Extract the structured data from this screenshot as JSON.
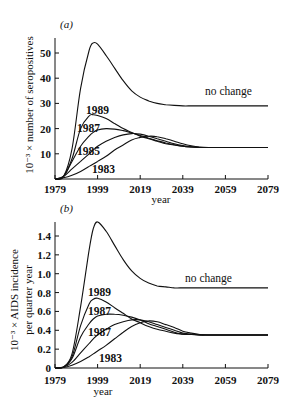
{
  "chart_data": [
    {
      "type": "line",
      "panel": "(a)",
      "title": "",
      "xlabel": "year",
      "ylabel": "10⁻³ × number of seropositives",
      "xlim": [
        1979,
        2079
      ],
      "ylim": [
        0,
        55
      ],
      "xticks": [
        "1979",
        "1999",
        "2019",
        "2039",
        "2059",
        "2079"
      ],
      "yticks": [
        "10",
        "20",
        "30",
        "40",
        "50"
      ],
      "grid": false,
      "x": [
        1979,
        1983,
        1987,
        1991,
        1995,
        1997,
        1999,
        2003,
        2007,
        2011,
        2015,
        2019,
        2023,
        2027,
        2031,
        2035,
        2039,
        2043,
        2047,
        2051,
        2055,
        2059,
        2063,
        2067,
        2071,
        2075,
        2079
      ],
      "series": [
        {
          "name": "no change",
          "values": [
            0,
            1,
            12,
            36,
            51,
            54,
            53.5,
            49,
            44,
            39,
            35,
            32.5,
            31,
            30,
            29.5,
            29.2,
            29,
            29,
            29,
            29,
            29,
            29,
            29,
            29,
            29,
            29,
            29
          ]
        },
        {
          "name": "1989",
          "values": [
            0,
            1,
            8,
            20,
            25,
            25.5,
            25.2,
            24,
            22,
            20,
            18.5,
            17,
            16,
            15,
            14,
            13.5,
            13,
            12.7,
            12.5,
            12.5,
            12.5,
            12.5,
            12.5,
            12.5,
            12.5,
            12.5,
            12.5
          ]
        },
        {
          "name": "1987",
          "values": [
            0,
            1,
            7,
            13,
            17,
            18.5,
            19.5,
            20,
            19.8,
            19.2,
            18.3,
            17.3,
            16.2,
            15.2,
            14.3,
            13.6,
            13,
            12.7,
            12.5,
            12.5,
            12.5,
            12.5,
            12.5,
            12.5,
            12.5,
            12.5,
            12.5
          ]
        },
        {
          "name": "1985",
          "values": [
            0,
            1,
            4,
            7,
            10,
            11.5,
            13,
            15,
            16.5,
            17.5,
            18,
            17.8,
            17,
            16,
            15,
            14,
            13.3,
            12.8,
            12.5,
            12.5,
            12.5,
            12.5,
            12.5,
            12.5,
            12.5,
            12.5,
            12.5
          ]
        },
        {
          "name": "1983",
          "values": [
            0,
            0.5,
            1.5,
            3,
            5,
            6,
            7,
            9,
            11.5,
            13.5,
            15.5,
            16.5,
            17,
            16.8,
            16,
            15,
            14,
            13.2,
            12.7,
            12.5,
            12.5,
            12.5,
            12.5,
            12.5,
            12.5,
            12.5,
            12.5
          ]
        }
      ]
    },
    {
      "type": "line",
      "panel": "(b)",
      "title": "",
      "xlabel": "year",
      "ylabel": "10⁻³ × AIDS incidence per quarter year",
      "xlim": [
        1979,
        2079
      ],
      "ylim": [
        0,
        1.6
      ],
      "xticks": [
        "1979",
        "1999",
        "2019",
        "2039",
        "2059",
        "2079"
      ],
      "yticks": [
        "0",
        "0.2",
        "0.4",
        "0.6",
        "0.8",
        "1.0",
        "1.2",
        "1.4"
      ],
      "grid": false,
      "x": [
        1979,
        1983,
        1987,
        1991,
        1995,
        1997,
        1999,
        2003,
        2007,
        2011,
        2015,
        2019,
        2023,
        2027,
        2031,
        2035,
        2039,
        2043,
        2047,
        2051,
        2055,
        2059,
        2063,
        2067,
        2071,
        2075,
        2079
      ],
      "series": [
        {
          "name": "no change",
          "values": [
            0,
            0.01,
            0.15,
            0.65,
            1.25,
            1.48,
            1.55,
            1.45,
            1.3,
            1.15,
            1.03,
            0.95,
            0.9,
            0.87,
            0.86,
            0.85,
            0.85,
            0.85,
            0.85,
            0.85,
            0.85,
            0.85,
            0.85,
            0.85,
            0.85,
            0.85,
            0.85
          ]
        },
        {
          "name": "1989",
          "values": [
            0,
            0.01,
            0.12,
            0.45,
            0.68,
            0.73,
            0.74,
            0.7,
            0.64,
            0.58,
            0.52,
            0.48,
            0.44,
            0.41,
            0.39,
            0.37,
            0.36,
            0.355,
            0.35,
            0.35,
            0.35,
            0.35,
            0.35,
            0.35,
            0.35,
            0.35,
            0.35
          ]
        },
        {
          "name": "1987",
          "values": [
            0,
            0.01,
            0.1,
            0.33,
            0.47,
            0.52,
            0.55,
            0.57,
            0.57,
            0.56,
            0.54,
            0.51,
            0.47,
            0.44,
            0.41,
            0.38,
            0.36,
            0.355,
            0.35,
            0.35,
            0.35,
            0.35,
            0.35,
            0.35,
            0.35,
            0.35,
            0.35
          ]
        },
        {
          "name": "1987",
          "values": [
            0,
            0.01,
            0.06,
            0.16,
            0.26,
            0.31,
            0.35,
            0.41,
            0.46,
            0.49,
            0.51,
            0.51,
            0.49,
            0.46,
            0.43,
            0.4,
            0.37,
            0.36,
            0.35,
            0.35,
            0.35,
            0.35,
            0.35,
            0.35,
            0.35,
            0.35,
            0.35
          ]
        },
        {
          "name": "1983",
          "values": [
            0,
            0.005,
            0.03,
            0.07,
            0.12,
            0.15,
            0.18,
            0.24,
            0.31,
            0.38,
            0.44,
            0.48,
            0.5,
            0.49,
            0.46,
            0.43,
            0.39,
            0.37,
            0.355,
            0.35,
            0.35,
            0.35,
            0.35,
            0.35,
            0.35,
            0.35,
            0.35
          ]
        }
      ]
    }
  ],
  "panels": [
    {
      "label": "(a)",
      "ylabel": "10⁻³ × number of seropositives",
      "xlabel": "year",
      "curve_labels": [
        "no change",
        "1989",
        "1987",
        "1985",
        "1983"
      ]
    },
    {
      "label": "(b)",
      "ylabel_line1": "10⁻³ × AIDS incidence",
      "ylabel_line2": "per quarter year",
      "xlabel": "year",
      "curve_labels": [
        "no change",
        "1989",
        "1987",
        "1987",
        "1983"
      ]
    }
  ]
}
